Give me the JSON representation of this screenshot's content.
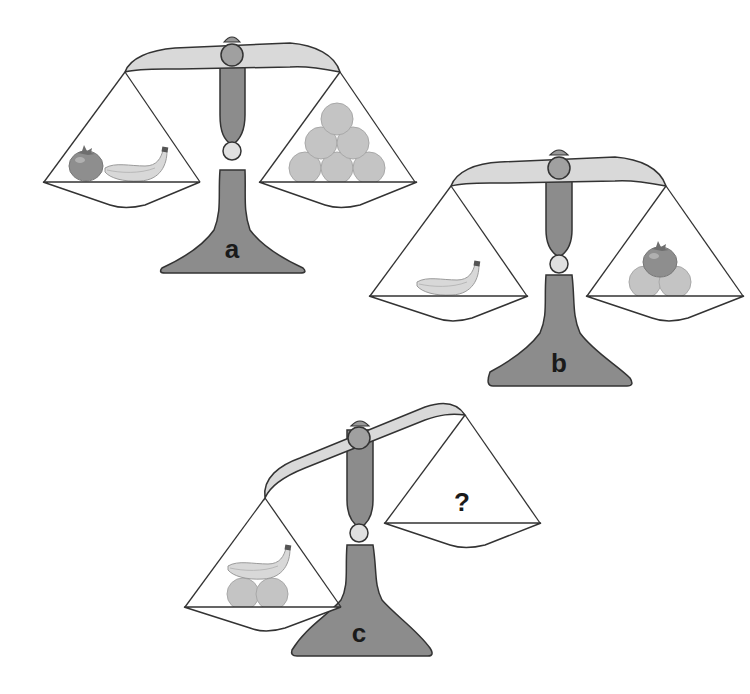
{
  "puzzle": {
    "type": "balance-scale-puzzle",
    "scales": [
      {
        "label": "a",
        "state": "balanced",
        "left_pan": [
          "tomato",
          "banana"
        ],
        "right_pan": [
          "ball",
          "ball",
          "ball",
          "ball",
          "ball",
          "ball"
        ]
      },
      {
        "label": "b",
        "state": "balanced",
        "left_pan": [
          "banana"
        ],
        "right_pan": [
          "tomato",
          "ball",
          "ball"
        ]
      },
      {
        "label": "c",
        "state": "left-heavy",
        "left_pan": [
          "banana",
          "ball",
          "ball"
        ],
        "right_pan": [],
        "unknown": "?"
      }
    ],
    "colors": {
      "beam": "#d9d9d9",
      "stand": "#8c8c8c",
      "pivot": "#a6a6a6",
      "joint": "#e0e0e0",
      "ball": "#bfbfbf",
      "tomato": "#8a8a8a",
      "banana": "#d6d6d6",
      "outline": "#333333"
    }
  }
}
